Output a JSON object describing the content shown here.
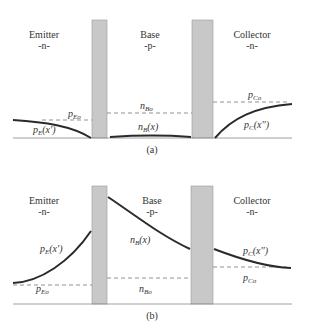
{
  "colors": {
    "depletion": "#c8c8c8",
    "curve": "#2a2a2a",
    "axis": "#888888",
    "dashed": "#777777"
  },
  "panels": [
    {
      "caption": "(a)",
      "regions": [
        {
          "name": "Emitter",
          "type": "-n-"
        },
        {
          "name": "Base",
          "type": "-p-"
        },
        {
          "name": "Collector",
          "type": "-n-"
        }
      ],
      "labels": {
        "emitter_eq": {
          "main": "p",
          "sub": "Eo"
        },
        "emitter_curve": {
          "main": "p",
          "sub": "E",
          "arg": "(x')"
        },
        "base_eq": {
          "main": "n",
          "sub": "Bo"
        },
        "base_curve": {
          "main": "n",
          "sub": "B",
          "arg": "(x)"
        },
        "collector_eq": {
          "main": "p",
          "sub": "Co"
        },
        "collector_curve": {
          "main": "p",
          "sub": "C",
          "arg": "(x'')"
        }
      }
    },
    {
      "caption": "(b)",
      "regions": [
        {
          "name": "Emitter",
          "type": "-n-"
        },
        {
          "name": "Base",
          "type": "-p-"
        },
        {
          "name": "Collector",
          "type": "-n-"
        }
      ],
      "labels": {
        "emitter_eq": {
          "main": "p",
          "sub": "Eo"
        },
        "emitter_curve": {
          "main": "p",
          "sub": "E",
          "arg": "(x')"
        },
        "base_eq": {
          "main": "n",
          "sub": "Bo"
        },
        "base_curve": {
          "main": "n",
          "sub": "B",
          "arg": "(x)"
        },
        "collector_eq": {
          "main": "p",
          "sub": "Co"
        },
        "collector_curve": {
          "main": "p",
          "sub": "C",
          "arg": "(x'')"
        }
      }
    }
  ]
}
